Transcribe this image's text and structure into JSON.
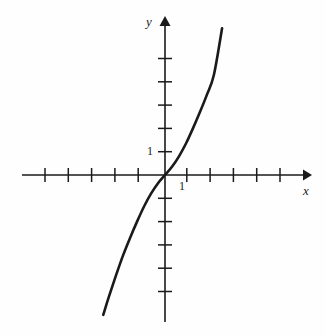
{
  "figure": {
    "background_color": "#fefefe",
    "ink_color": "#1a1a1a",
    "width": 326,
    "height": 336
  },
  "labels": {
    "y_axis": "y",
    "x_axis": "x",
    "y_tick_one": "1",
    "x_tick_one": "1"
  },
  "chart_data": {
    "type": "line",
    "title": "",
    "xlabel": "x",
    "ylabel": "y",
    "grid": false,
    "legend": "none",
    "axis_style": "arrows-both-ends",
    "origin_px": [
      165,
      175
    ],
    "unit_px": 23.3,
    "xlim": [
      -6.1,
      6.2
    ],
    "ylim": [
      -6.3,
      6.8
    ],
    "x_ticks": [
      -5,
      -4,
      -3,
      -2,
      -1,
      1,
      2,
      3,
      4,
      5
    ],
    "y_ticks": [
      -5,
      -4,
      -3,
      -2,
      -1,
      1,
      2,
      3,
      4,
      5
    ],
    "labeled_ticks": {
      "x": [
        1
      ],
      "y": [
        1
      ]
    },
    "series": [
      {
        "name": "cubic",
        "description": "odd increasing function through origin, inflection at origin",
        "x": [
          -2.65,
          -2.4,
          -2.1,
          -1.8,
          -1.5,
          -1.2,
          -0.9,
          -0.6,
          -0.3,
          0.0,
          0.3,
          0.6,
          0.9,
          1.2,
          1.5,
          1.8,
          2.1,
          2.45
        ],
        "y": [
          -6.0,
          -5.2,
          -4.3,
          -3.45,
          -2.7,
          -2.0,
          -1.35,
          -0.8,
          -0.35,
          0.0,
          0.35,
          0.8,
          1.35,
          2.0,
          2.7,
          3.45,
          4.3,
          6.3
        ],
        "line_width_px": 2.6,
        "color": "#1a1a1a"
      }
    ]
  },
  "curve_path": "M 103.2 313.0 C 112 297 124 278 135 258 C 146 238 154 218 160 198 C 163 189 164.2 182 165 175 C 165.8 168 167 161 170 152 C 176 132 184 112 195 90 C 205 68 213 48 222.2 28.5"
}
